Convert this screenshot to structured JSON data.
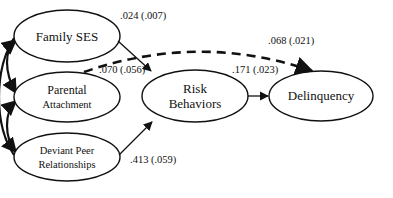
{
  "diagram": {
    "type": "path-model",
    "nodes": [
      {
        "id": "family_ses",
        "lines": [
          "Family SES"
        ],
        "cx": 67,
        "cy": 36,
        "rx": 53,
        "ry": 26
      },
      {
        "id": "parental_attachment",
        "lines": [
          "Parental",
          "Attachment"
        ],
        "cx": 67,
        "cy": 97,
        "rx": 53,
        "ry": 25
      },
      {
        "id": "deviant_peer",
        "lines": [
          "Deviant Peer",
          "Relationships"
        ],
        "cx": 67,
        "cy": 157,
        "rx": 53,
        "ry": 24
      },
      {
        "id": "risk_behaviors",
        "lines": [
          "Risk",
          "Behaviors"
        ],
        "cx": 195,
        "cy": 96,
        "rx": 53,
        "ry": 26
      },
      {
        "id": "delinquency",
        "lines": [
          "Delinquency"
        ],
        "cx": 321,
        "cy": 96,
        "rx": 52,
        "ry": 25
      }
    ],
    "edges": [
      {
        "from": "family_ses",
        "to": "risk_behaviors",
        "style": "solid",
        "label": ".024 (.007)"
      },
      {
        "from": "parental_attachment",
        "to": "delinquency",
        "style": "dashed",
        "label": ".068 (.021)"
      },
      {
        "from": "parental_attachment",
        "to": "risk_behaviors",
        "style": "dashed",
        "label": ".070 (.056)"
      },
      {
        "from": "deviant_peer",
        "to": "risk_behaviors",
        "style": "solid",
        "label": ".413 (.059)"
      },
      {
        "from": "risk_behaviors",
        "to": "delinquency",
        "style": "solid",
        "label": ".171 (.023)"
      }
    ],
    "correlations": [
      {
        "between": [
          "family_ses",
          "parental_attachment"
        ],
        "style": "curved-double-arrow"
      },
      {
        "between": [
          "parental_attachment",
          "deviant_peer"
        ],
        "style": "curved-double-arrow"
      },
      {
        "between": [
          "family_ses",
          "deviant_peer"
        ],
        "style": "curved-double-arrow"
      }
    ]
  },
  "labels": {
    "family_ses": "Family SES",
    "parental_1": "Parental",
    "parental_2": "Attachment",
    "deviant_1": "Deviant Peer",
    "deviant_2": "Relationships",
    "risk_1": "Risk",
    "risk_2": "Behaviors",
    "delinquency": "Delinquency",
    "coef_ses_risk": ".024 (.007)",
    "coef_dashed_path": ".070 (.056)",
    "coef_parental_delinq": ".068 (.021)",
    "coef_risk_delinq": ".171 (.023)",
    "coef_peer_risk": ".413 (.059)"
  },
  "colors": {
    "line": "#111111",
    "background": "#ffffff"
  }
}
